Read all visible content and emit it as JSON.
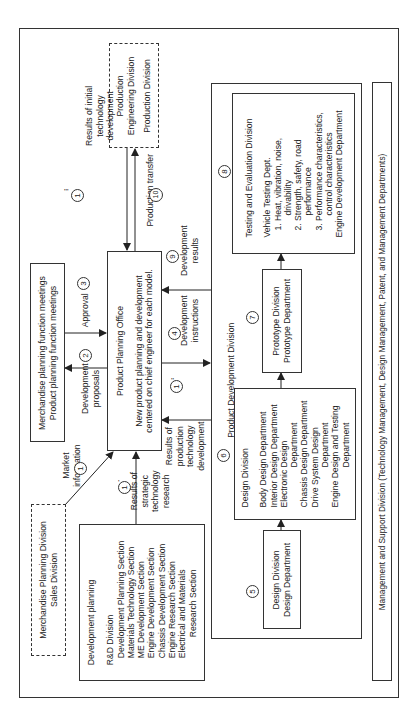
{
  "diagram": {
    "orientation": "rotated -90deg (text reads bottom-to-top)",
    "boxes": {
      "production_engineering": {
        "lines": [
          "Production",
          "Engineering Division",
          "",
          "Production Division"
        ],
        "style": "dashed"
      },
      "merchandise_meetings": {
        "lines": [
          "Merchandise planning function meetings",
          "Product planning function meetings"
        ]
      },
      "product_planning_office": {
        "title": "Product Planning Office",
        "lines": [
          "New product planning and development",
          "centered on chief engineer for each model."
        ]
      },
      "merchandise_planning_division": {
        "lines": [
          "Merchandise Planning Division",
          "Sales Division"
        ],
        "style": "dashed"
      },
      "rd_division": {
        "heading": "Development planning",
        "title": "R&D Division",
        "sections": [
          "Development Planning Section",
          "Materials Technology Section",
          "ME Development Section",
          "Engine Development Section",
          "Chassis Development Section",
          "Engine Research Section",
          "Electrical and Materials",
          "Research Section"
        ]
      },
      "product_development_division": {
        "title": "Product Development Division"
      },
      "testing_evaluation": {
        "title": "Testing and Evaluation Division",
        "dept": "Vehicle Testing Dept.",
        "items": [
          "1. Heat, vibration, noise,",
          "drivability",
          "2. Strength, safety, road",
          "performance",
          "3. Performance characteristics,",
          "control characteristics"
        ],
        "footer": "Engine Development Department"
      },
      "prototype": {
        "lines": [
          "Prototype Division",
          "Prototype Department"
        ]
      },
      "design_division": {
        "title": "Design Division",
        "items": [
          "Body Design Department",
          "Interior Design Department",
          "Electronic Design",
          "Department",
          "Chassis Design Department",
          "Drive System Design",
          "Department",
          "Engine Design and Testing",
          "Department"
        ]
      },
      "design_dept": {
        "lines": [
          "Design Division",
          "Design Department"
        ]
      },
      "management_support": {
        "text": "Management and Support Division (Technology Management, Design Management, Patent, and Management Departments)"
      }
    },
    "flows": [
      {
        "num": "1",
        "prime": "",
        "label": [
          "Market",
          "information"
        ]
      },
      {
        "num": "1",
        "prime": "'",
        "label": [
          "Results of",
          "strategic",
          "technology",
          "research"
        ]
      },
      {
        "num": "1",
        "prime": "''",
        "label": [
          "Results of",
          "production",
          "technology",
          "development"
        ]
      },
      {
        "num": "1",
        "prime": "'''",
        "label": [
          "Results of initial",
          "technology",
          "development"
        ]
      },
      {
        "num": "2",
        "label": [
          "Development",
          "proposals"
        ]
      },
      {
        "num": "3",
        "label": [
          "Approval"
        ]
      },
      {
        "num": "4",
        "label": [
          "Development",
          "instructions"
        ]
      },
      {
        "num": "5",
        "label": []
      },
      {
        "num": "6",
        "label": []
      },
      {
        "num": "7",
        "label": []
      },
      {
        "num": "8",
        "label": []
      },
      {
        "num": "9",
        "label": [
          "Development",
          "results"
        ]
      },
      {
        "num": "10",
        "label": [
          "Production transfer"
        ]
      }
    ]
  }
}
